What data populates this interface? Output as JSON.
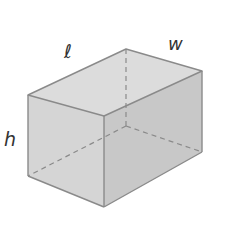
{
  "diagram": {
    "type": "rectangular-prism",
    "labels": {
      "length": "ℓ",
      "width": "w",
      "height": "h"
    },
    "colors": {
      "edge": "#8a8a8a",
      "top_face": "#dcdcdc",
      "front_face": "#d4d4d4",
      "right_face": "#c6c6c6",
      "label": "#333333"
    }
  }
}
